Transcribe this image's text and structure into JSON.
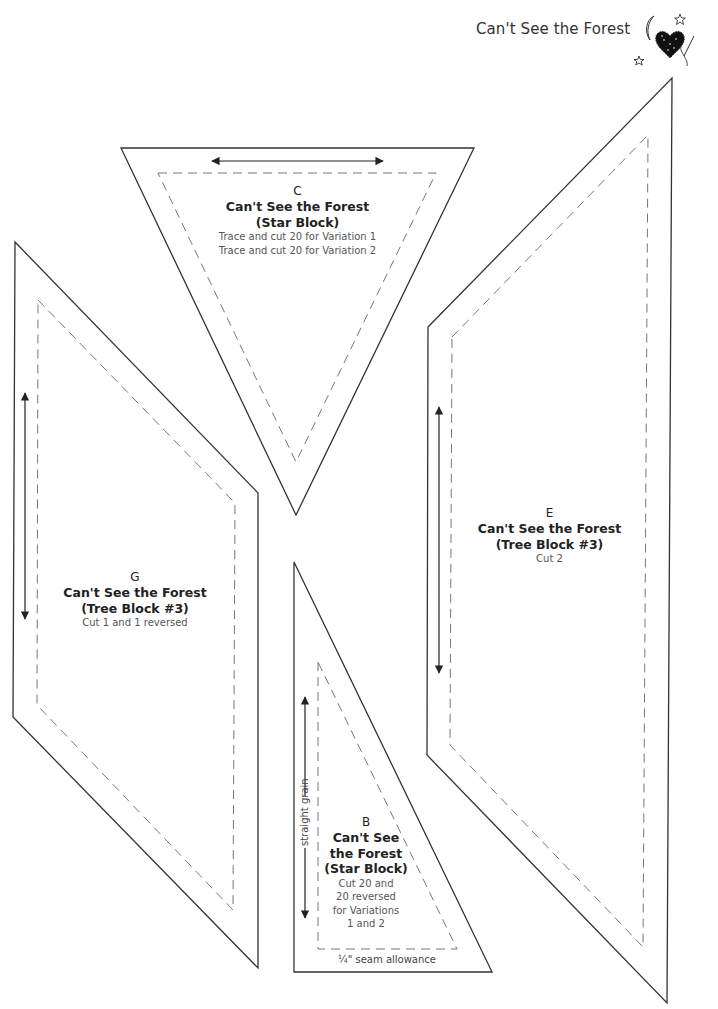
{
  "header": {
    "title": "Can't See the Forest",
    "logo_icon": "heart-moon-stars-needle-icon"
  },
  "pieces": [
    {
      "id": "C",
      "letter": "C",
      "name_line1": "Can't See the Forest",
      "name_line2": "(Star Block)",
      "instructions": [
        "Trace and cut 20 for Variation 1",
        "Trace and cut 20 for Variation 2"
      ],
      "grain": "horizontal"
    },
    {
      "id": "G",
      "letter": "G",
      "name_line1": "Can't See the Forest",
      "name_line2": "(Tree Block #3)",
      "instructions": [
        "Cut 1 and 1 reversed"
      ],
      "grain": "vertical"
    },
    {
      "id": "E",
      "letter": "E",
      "name_line1": "Can't See the Forest",
      "name_line2": "(Tree Block #3)",
      "instructions": [
        "Cut 2"
      ],
      "grain": "vertical"
    },
    {
      "id": "B",
      "letter": "B",
      "name_lines": [
        "Can't See",
        "the Forest",
        "(Star Block)"
      ],
      "instructions": [
        "Cut 20 and",
        "20 reversed",
        "for Variations",
        "1 and 2"
      ],
      "grain": "vertical",
      "grain_label": "straight grain",
      "seam_label": "¼\" seam allowance"
    }
  ],
  "colors": {
    "cut_line": "#333333",
    "seam_line": "#777777",
    "background": "#ffffff"
  }
}
